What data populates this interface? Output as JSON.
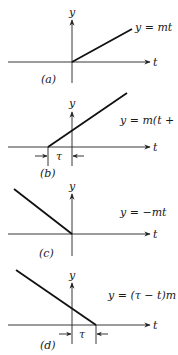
{
  "panels": [
    {
      "id": "a",
      "caption": "(a)",
      "y_label": "y",
      "t_label": "t",
      "equation": "y = mt"
    },
    {
      "id": "b",
      "caption": "(b)",
      "y_label": "y",
      "t_label": "t",
      "equation": "y = m(t + τ)",
      "interval_label": "τ"
    },
    {
      "id": "c",
      "caption": "(c)",
      "y_label": "y",
      "t_label": "t",
      "equation": "y = −mt"
    },
    {
      "id": "d",
      "caption": "(d)",
      "y_label": "y",
      "t_label": "t",
      "equation": "y = (τ − t)m",
      "interval_label": "τ"
    }
  ],
  "colors": {
    "line": "#111111",
    "axis": "#222222",
    "background": "#ffffff"
  }
}
